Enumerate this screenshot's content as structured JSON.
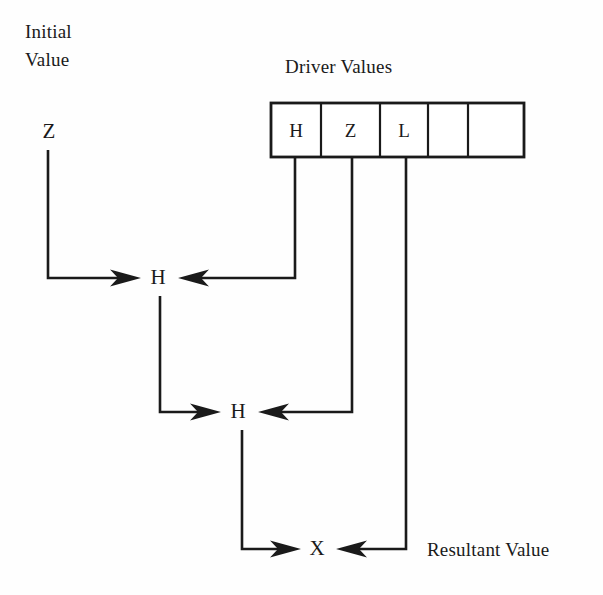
{
  "diagram": {
    "title_labels": {
      "initial_value_line1": "Initial",
      "initial_value_line2": "Value",
      "driver_values": "Driver Values",
      "resultant_value": "Resultant Value"
    },
    "initial_value": {
      "symbol": "Z"
    },
    "driver_cells": [
      {
        "label": "H"
      },
      {
        "label": "Z"
      },
      {
        "label": "L"
      },
      {
        "label": ""
      },
      {
        "label": ""
      }
    ],
    "resolution_nodes": [
      {
        "symbol": "H"
      },
      {
        "symbol": "H"
      },
      {
        "symbol": "X"
      }
    ],
    "colors": {
      "ink": "#1a1a1a",
      "background": "#fefefe"
    }
  }
}
